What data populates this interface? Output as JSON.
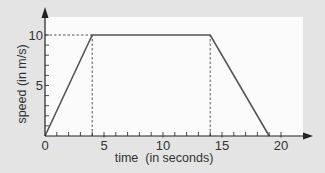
{
  "chart_data": {
    "type": "line",
    "title": "",
    "xlabel": "time  (in seconds)",
    "ylabel": "speed (in m/s)",
    "xlim": [
      0,
      22
    ],
    "ylim": [
      0,
      11
    ],
    "x_ticks": [
      0,
      5,
      10,
      15,
      20
    ],
    "y_ticks": [
      5,
      10
    ],
    "x_minor_step": 1,
    "y_minor_step": 1,
    "grid": false,
    "series": [
      {
        "name": "speed",
        "x": [
          0,
          4,
          14,
          19
        ],
        "y": [
          0,
          10,
          10,
          0
        ]
      }
    ],
    "reference_lines": [
      {
        "type": "horizontal-dashed",
        "y": 10,
        "x_from": 0,
        "x_to": 4
      },
      {
        "type": "vertical-dashed",
        "x": 4,
        "y_from": 0,
        "y_to": 10
      },
      {
        "type": "vertical-dashed",
        "x": 14,
        "y_from": 0,
        "y_to": 10
      }
    ],
    "legend": null
  },
  "colors": {
    "background": "#e4e4e4",
    "plot_area": "#fbfbfb",
    "line": "#555555",
    "axis": "#222222"
  }
}
